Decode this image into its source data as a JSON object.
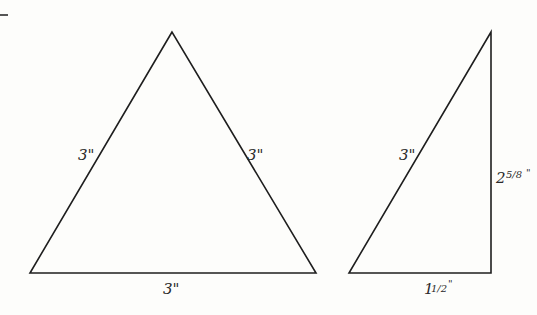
{
  "diagram": {
    "equilateral_triangle": {
      "left_side": "3\"",
      "right_side": "3\"",
      "base": "3\""
    },
    "right_triangle": {
      "hypotenuse": "3\"",
      "height_whole": "2",
      "height_fraction": "5/8",
      "height_unit": "\"",
      "base_whole": "1",
      "base_fraction": "1/2",
      "base_unit": "\""
    }
  },
  "colors": {
    "line": "#1e1e1e",
    "background": "#fdfdfb"
  }
}
